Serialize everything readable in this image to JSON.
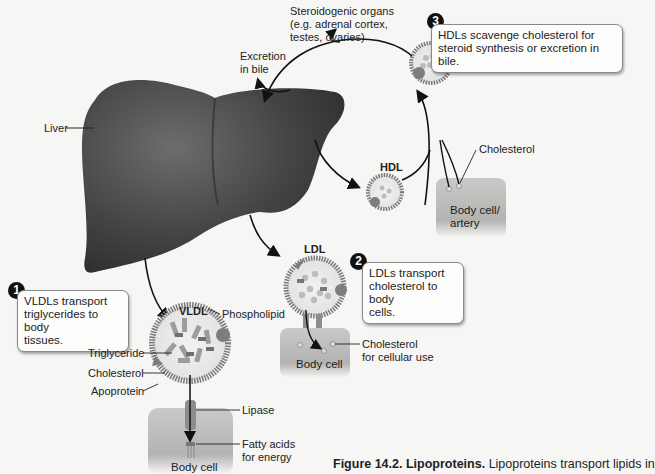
{
  "figure": {
    "caption_label": "Figure 14.2.",
    "caption_title": "Lipoproteins.",
    "caption_text": "Lipoproteins transport lipids in",
    "caption_text_line2": "blood. Which type of lipoprotein picks up cholesterol for"
  },
  "organs": {
    "liver": "Liver",
    "steroidogenic_line1": "Steroidogenic organs",
    "steroidogenic_line2": "(e.g. adrenal cortex,",
    "steroidogenic_line3": "testes, ovaries)",
    "excretion_line1": "Excretion",
    "excretion_line2": "in bile"
  },
  "callouts": [
    {
      "number": "1",
      "line1": "VLDLs transport",
      "line2": "triglycerides to body",
      "line3": "tissues."
    },
    {
      "number": "2",
      "line1": "LDLs transport",
      "line2": "cholesterol to body",
      "line3": "cells."
    },
    {
      "number": "3",
      "line1": "HDLs scavenge cholesterol for",
      "line2": "steroid synthesis or excretion in bile."
    }
  ],
  "particles": {
    "vldl": "VLDL",
    "ldl": "LDL",
    "hdl": "HDL"
  },
  "vldl_parts": {
    "phospholipid": "Phospholipid",
    "triglyceride": "Triglyceride",
    "cholesterol": "Cholesterol",
    "apoprotein": "Apoprotein",
    "lipase": "Lipase",
    "fatty_acids_line1": "Fatty acids",
    "fatty_acids_line2": "for energy",
    "body_cell": "Body cell"
  },
  "ldl_parts": {
    "cholesterol_line1": "Cholesterol",
    "cholesterol_line2": "for cellular use",
    "body_cell": "Body cell"
  },
  "hdl_parts": {
    "cholesterol": "Cholesterol",
    "body_cell_line1": "Body cell/",
    "body_cell_line2": "artery"
  },
  "colors": {
    "liver": "#3e3e3e",
    "cell": "#b9b9b7",
    "particle_shell": "#8c8c8c",
    "callout_border": "#8a8a8a",
    "number_badge": "#111111"
  }
}
